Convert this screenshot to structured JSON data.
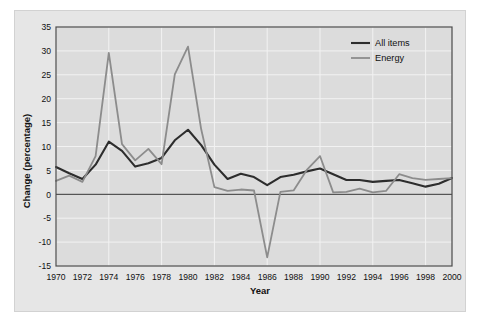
{
  "chart_data": {
    "type": "line",
    "title": "",
    "xlabel": "Year",
    "ylabel": "Change (percentage)",
    "xlim": [
      1970,
      2000
    ],
    "ylim": [
      -15,
      35
    ],
    "yticks": [
      -15,
      -10,
      -5,
      0,
      5,
      10,
      15,
      20,
      25,
      30,
      35
    ],
    "ytick_labels": [
      "-15",
      "-10",
      "-5",
      "0",
      "5",
      "10",
      "15",
      "20",
      "25",
      "30",
      "35"
    ],
    "xticks": [
      1970,
      1972,
      1974,
      1976,
      1978,
      1980,
      1982,
      1984,
      1986,
      1988,
      1990,
      1992,
      1994,
      1996,
      1998,
      2000
    ],
    "xtick_labels": [
      "1970",
      "1972",
      "1974",
      "1976",
      "1978",
      "1980",
      "1982",
      "1984",
      "1986",
      "1988",
      "1990",
      "1992",
      "1994",
      "1996",
      "1998",
      "2000"
    ],
    "grid": true,
    "grid_color": "#f2f2f2",
    "plot_bg": "#dcdcdc",
    "zero_line": 0,
    "legend_position": "top-right",
    "x": [
      1970,
      1971,
      1972,
      1973,
      1974,
      1975,
      1976,
      1977,
      1978,
      1979,
      1980,
      1981,
      1982,
      1983,
      1984,
      1985,
      1986,
      1987,
      1988,
      1989,
      1990,
      1991,
      1992,
      1993,
      1994,
      1995,
      1996,
      1997,
      1998,
      1999,
      2000
    ],
    "series": [
      {
        "name": "All items",
        "color": "#2d2d2d",
        "values": [
          5.7,
          4.4,
          3.2,
          6.2,
          11.0,
          9.1,
          5.8,
          6.5,
          7.6,
          11.3,
          13.5,
          10.3,
          6.2,
          3.2,
          4.3,
          3.6,
          1.9,
          3.6,
          4.1,
          4.8,
          5.4,
          4.2,
          3.0,
          3.0,
          2.6,
          2.8,
          3.0,
          2.3,
          1.6,
          2.2,
          3.4
        ]
      },
      {
        "name": "Energy",
        "color": "#8c8c8c",
        "values": [
          2.8,
          3.9,
          2.6,
          8.0,
          29.6,
          10.5,
          7.1,
          9.5,
          6.3,
          25.1,
          30.9,
          13.6,
          1.5,
          0.7,
          1.0,
          0.8,
          -13.2,
          0.5,
          0.8,
          5.1,
          8.0,
          0.4,
          0.5,
          1.2,
          0.4,
          0.7,
          4.2,
          3.4,
          3.0,
          3.2,
          3.4
        ]
      }
    ]
  },
  "legend": {
    "items": [
      {
        "label": "All items",
        "color": "#2d2d2d"
      },
      {
        "label": "Energy",
        "color": "#8c8c8c"
      }
    ]
  },
  "axes": {
    "x_title": "Year",
    "y_title": "Change (percentage)"
  }
}
